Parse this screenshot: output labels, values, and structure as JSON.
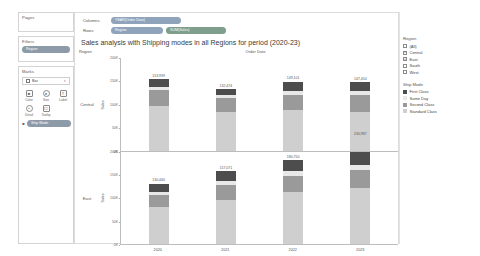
{
  "shelves": {
    "pages_label": "Pages",
    "filters_label": "Filters",
    "filters_pill": "Region",
    "marks_label": "Marks",
    "marks_type": "Bar",
    "marks_buttons": [
      {
        "name": "color",
        "label": "Color",
        "icon": "color-icon"
      },
      {
        "name": "size",
        "label": "Size",
        "icon": "size-icon"
      },
      {
        "name": "label",
        "label": "Label",
        "icon": "label-icon"
      },
      {
        "name": "detail",
        "label": "Detail",
        "icon": "detail-icon"
      },
      {
        "name": "tooltip",
        "label": "Tooltip",
        "icon": "tooltip-icon"
      }
    ],
    "marks_pill": "Ship Mode",
    "columns_label": "Columns",
    "columns_pill": "YEAR(Order Date)",
    "rows_label": "Rows",
    "rows_pills": [
      "Region",
      "SUM(Sales)"
    ]
  },
  "sheet": {
    "title": "Sales analysis with Shipping modes in all Regions for period (2020-23)",
    "header_region": "Region",
    "header_date": "Order Date",
    "axis_title": "Sales"
  },
  "region_filter": {
    "title": "Region",
    "items": [
      {
        "label": "(All)",
        "checked": false
      },
      {
        "label": "Central",
        "checked": true
      },
      {
        "label": "East",
        "checked": true
      },
      {
        "label": "South",
        "checked": false
      },
      {
        "label": "West",
        "checked": false
      }
    ]
  },
  "ship_mode_legend": {
    "title": "Ship Mode",
    "items": [
      {
        "label": "First Class",
        "color": "#4d4d4d"
      },
      {
        "label": "Same Day",
        "color": "#e8e8e8"
      },
      {
        "label": "Second Class",
        "color": "#9a9a9a"
      },
      {
        "label": "Standard Class",
        "color": "#cfcfcf"
      }
    ]
  },
  "chart_data": {
    "type": "bar",
    "title": "Sales analysis with Shipping modes in all Regions for period (2020-23)",
    "xlabel": "Order Date",
    "ylabel": "Sales",
    "ylim": [
      0,
      200000
    ],
    "yticks": [
      "0K",
      "50K",
      "100K",
      "150K",
      "200K"
    ],
    "ytick_values": [
      0,
      50000,
      100000,
      150000,
      200000
    ],
    "grid": false,
    "legend_position": "right",
    "stacked": true,
    "categories": [
      "2020",
      "2021",
      "2022",
      "2023"
    ],
    "panels": [
      {
        "region": "Central",
        "totals": [
          153939,
          132474,
          149101,
          147454
        ],
        "totals_display": [
          "153,939",
          "132,474",
          "149,101",
          "147,454"
        ],
        "series": [
          {
            "name": "Standard Class",
            "color": "#cfcfcf",
            "values": [
              96000,
              83000,
              88000,
              83000
            ]
          },
          {
            "name": "Second Class",
            "color": "#9a9a9a",
            "values": [
              34000,
              30000,
              32000,
              36000
            ]
          },
          {
            "name": "Same Day",
            "color": "#e8e8e8",
            "values": [
              8000,
              7000,
              9000,
              10000
            ]
          },
          {
            "name": "First Class",
            "color": "#4d4d4d",
            "values": [
              15939,
              12474,
              20101,
              18454
            ]
          }
        ]
      },
      {
        "region": "East",
        "totals": [
          130440,
          157071,
          180750,
          230987
        ],
        "totals_display": [
          "130,440",
          "157,071",
          "180,750",
          "230,987"
        ],
        "series": [
          {
            "name": "Standard Class",
            "color": "#cfcfcf",
            "values": [
              80000,
              95000,
              112000,
              140000
            ]
          },
          {
            "name": "Second Class",
            "color": "#9a9a9a",
            "values": [
              26000,
              33000,
              36000,
              46000
            ]
          },
          {
            "name": "Same Day",
            "color": "#e8e8e8",
            "values": [
              7000,
              8000,
              9000,
              12000
            ]
          },
          {
            "name": "First Class",
            "color": "#4d4d4d",
            "values": [
              17440,
              21071,
              23750,
              32987
            ]
          }
        ]
      }
    ]
  }
}
